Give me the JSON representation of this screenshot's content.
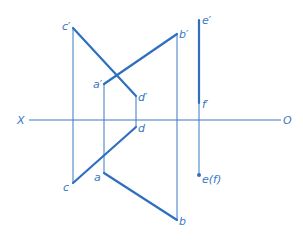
{
  "axis": {
    "left_label": "X",
    "right_label": "O"
  },
  "points": {
    "c_prime": "c′",
    "b_prime": "b′",
    "e_prime": "e′",
    "a_prime": "a′",
    "d_prime": "d′",
    "f_prime": "f′",
    "d": "d",
    "c": "c",
    "a": "a",
    "b": "b",
    "e_f": "e(f)"
  },
  "colors": {
    "line": "#3a78c4",
    "thick_line": "#2f6fbf",
    "background": "#ffffff"
  }
}
